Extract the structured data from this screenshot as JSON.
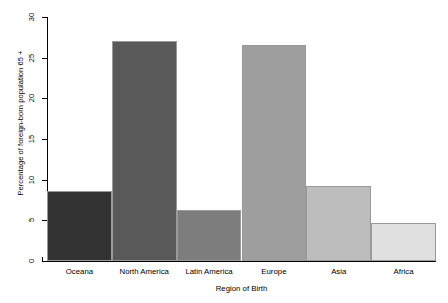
{
  "chart_data": {
    "type": "bar",
    "title": "",
    "subtitle": "",
    "xlabel": "Region of Birth",
    "ylabel": "Percentage of foreign-born population 65 +",
    "categories": [
      "Oceana",
      "North America",
      "Latin America",
      "Europe",
      "Asia",
      "Africa"
    ],
    "values": [
      8.6,
      27.0,
      6.3,
      26.6,
      9.2,
      4.7
    ],
    "colors": [
      "#333333",
      "#595959",
      "#7d7d7d",
      "#9e9e9e",
      "#bdbdbd",
      "#e0e0e0"
    ],
    "ylim": [
      0,
      30
    ],
    "yticks": [
      0,
      5,
      10,
      15,
      20,
      25,
      30
    ],
    "ytick_labels": [
      "0",
      "5",
      "10",
      "15",
      "20",
      "25",
      "30"
    ],
    "grid": false,
    "legend": null,
    "bar_border_color": "#9a9a9a",
    "axis_color": "#000000",
    "background": "#ffffff"
  },
  "axes": {
    "y_label_text": "Percentage of foreign-born population 65 +",
    "x_label_text": "Region of Birth"
  },
  "ticks": {
    "y": [
      {
        "label": "0",
        "value": 0
      },
      {
        "label": "5",
        "value": 5
      },
      {
        "label": "10",
        "value": 10
      },
      {
        "label": "15",
        "value": 15
      },
      {
        "label": "20",
        "value": 20
      },
      {
        "label": "25",
        "value": 25
      },
      {
        "label": "30",
        "value": 30
      }
    ]
  },
  "bars": [
    {
      "label": "Oceana",
      "value": 8.6
    },
    {
      "label": "North America",
      "value": 27.0
    },
    {
      "label": "Latin America",
      "value": 6.3
    },
    {
      "label": "Europe",
      "value": 26.6
    },
    {
      "label": "Asia",
      "value": 9.2
    },
    {
      "label": "Africa",
      "value": 4.7
    }
  ]
}
